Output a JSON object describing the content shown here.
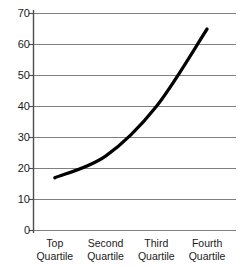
{
  "chart_data": {
    "type": "line",
    "title": "",
    "subtitle": "",
    "xlabel": "",
    "ylabel": "",
    "categories": [
      "Top Quartile",
      "Second Quartile",
      "Third Quartile",
      "Fourth Quartile"
    ],
    "category_lines": [
      [
        "Top",
        "Quartile"
      ],
      [
        "Second",
        "Quartile"
      ],
      [
        "Third",
        "Quartile"
      ],
      [
        "Fourth",
        "Quartile"
      ]
    ],
    "values": [
      17,
      24,
      40,
      65
    ],
    "series": [
      {
        "name": "",
        "values": [
          17,
          24,
          40,
          65
        ]
      }
    ],
    "ylim": [
      0,
      70
    ],
    "ytick_values": [
      0,
      10,
      20,
      30,
      40,
      50,
      60,
      70
    ],
    "ytick_labels": [
      "0",
      "10",
      "20",
      "30",
      "40",
      "50",
      "60",
      "70"
    ],
    "grid": true,
    "grid_axis": "y",
    "legend": false,
    "legend_position": "none",
    "markers": false,
    "smoothing": "curved",
    "colors": {
      "line": "#000000",
      "gridline": "#7f7f7f",
      "axis": "#000000",
      "text": "#1a1a1a",
      "background": "#ffffff"
    },
    "line_width_px": 3.2,
    "annotations": []
  }
}
